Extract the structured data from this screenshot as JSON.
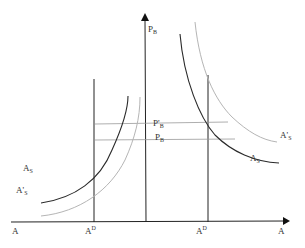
{
  "diagram": {
    "y_axis_label": "P",
    "y_axis_sub": "B",
    "x_axis_label": "A",
    "origin_label": "A",
    "left_vertical_label": "A",
    "left_vertical_sup": "D",
    "right_vertical_label": "A",
    "right_vertical_sup": "D",
    "price_high_label": "P'",
    "price_high_sub": "B",
    "price_low_label": "P",
    "price_low_sub": "B",
    "left_curve_dark_label": "A",
    "left_curve_dark_sub": "S",
    "left_curve_light_label": "A'",
    "left_curve_light_sub": "S",
    "right_curve_dark_label": "A",
    "right_curve_dark_sub": "S",
    "right_curve_light_label": "A'",
    "right_curve_light_sub": "S"
  },
  "colors": {
    "axis": "#222222",
    "curve_dark": "#2a2a2a",
    "curve_light": "#b5b5b5",
    "guide": "#9a9a9a"
  }
}
